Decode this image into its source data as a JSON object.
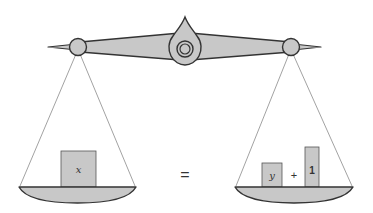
{
  "diagram": {
    "type": "balance-scale-equation",
    "colors": {
      "fill": "#c8c8c8",
      "stroke": "#333333",
      "string": "#888888",
      "text": "#333333",
      "background": "#ffffff"
    },
    "left_pan": {
      "items": [
        {
          "kind": "box",
          "label": "x"
        }
      ]
    },
    "relation": "=",
    "right_pan": {
      "items": [
        {
          "kind": "box",
          "label": "y"
        },
        {
          "kind": "operator",
          "label": "+"
        },
        {
          "kind": "box",
          "label": "1"
        }
      ]
    }
  }
}
